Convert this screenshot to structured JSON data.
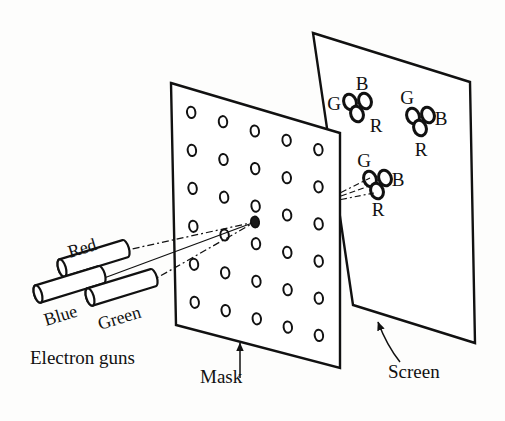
{
  "figure": {
    "background_color": "#fdfdfc",
    "ink_color": "#111111"
  },
  "labels": {
    "electron_guns": "Electron guns",
    "mask": "Mask",
    "screen": "Screen",
    "gun_red": "Red",
    "gun_blue": "Blue",
    "gun_green": "Green"
  },
  "guns": [
    {
      "name": "Red",
      "label": "Red",
      "x": 62,
      "y": 268,
      "length": 66,
      "radius": 9,
      "angle": -17,
      "label_x": 70,
      "label_y": 258
    },
    {
      "name": "Blue",
      "label": "Blue",
      "x": 38,
      "y": 294,
      "length": 66,
      "radius": 9,
      "angle": -17,
      "label_x": 46,
      "label_y": 326
    },
    {
      "name": "Green",
      "label": "Green",
      "x": 90,
      "y": 297,
      "length": 66,
      "radius": 9,
      "angle": -17,
      "label_x": 100,
      "label_y": 330
    }
  ],
  "mask": {
    "label": "Mask",
    "corners": [
      [
        171,
        83
      ],
      [
        340,
        133
      ],
      [
        340,
        368
      ],
      [
        176,
        325
      ]
    ],
    "hole_rows": 6,
    "hole_cols": 5,
    "hole_rx": 4.2,
    "hole_ry": 5.6,
    "label_x": 200,
    "label_y": 383,
    "arrow_from": [
      240,
      378
    ],
    "arrow_to": [
      240,
      343
    ]
  },
  "screen": {
    "label": "Screen",
    "corners": [
      [
        313,
        33
      ],
      [
        470,
        82
      ],
      [
        475,
        343
      ],
      [
        353,
        305
      ]
    ],
    "label_x": 388,
    "label_y": 378,
    "arrow_from": [
      400,
      362
    ],
    "arrow_to": [
      378,
      322
    ]
  },
  "triads": [
    {
      "name": "triad-upper-left",
      "cx": 358,
      "cy": 106,
      "dots": [
        {
          "phosphor": "G",
          "dx": -8,
          "dy": -4
        },
        {
          "phosphor": "B",
          "dx": 7,
          "dy": -5
        },
        {
          "phosphor": "R",
          "dx": -1,
          "dy": 8
        }
      ],
      "labels": [
        {
          "text": "G",
          "x": 334,
          "y": 106
        },
        {
          "text": "B",
          "x": 362,
          "y": 86
        },
        {
          "text": "R",
          "x": 376,
          "y": 128
        }
      ]
    },
    {
      "name": "triad-upper-right",
      "cx": 421,
      "cy": 120,
      "dots": [
        {
          "phosphor": "G",
          "dx": -8,
          "dy": -4
        },
        {
          "phosphor": "B",
          "dx": 7,
          "dy": -5
        },
        {
          "phosphor": "R",
          "dx": -1,
          "dy": 8
        }
      ],
      "labels": [
        {
          "text": "G",
          "x": 407,
          "y": 100
        },
        {
          "text": "B",
          "x": 441,
          "y": 121
        },
        {
          "text": "R",
          "x": 421,
          "y": 152
        }
      ]
    },
    {
      "name": "triad-center",
      "cx": 378,
      "cy": 183,
      "dots": [
        {
          "phosphor": "G",
          "dx": -8,
          "dy": -4
        },
        {
          "phosphor": "B",
          "dx": 7,
          "dy": -5
        },
        {
          "phosphor": "R",
          "dx": -1,
          "dy": 8
        }
      ],
      "labels": [
        {
          "text": "G",
          "x": 364,
          "y": 163
        },
        {
          "text": "B",
          "x": 398,
          "y": 182
        },
        {
          "text": "R",
          "x": 378,
          "y": 212
        }
      ]
    }
  ],
  "beams": {
    "converge_point": [
      255,
      222
    ],
    "gun_exits": [
      [
        118,
        252
      ],
      [
        96,
        281
      ],
      [
        148,
        283
      ]
    ],
    "screen_targets": [
      [
        370,
        178
      ],
      [
        378,
        183
      ],
      [
        374,
        193
      ]
    ],
    "mask_exit": [
      341,
      196
    ]
  },
  "phosphor_legend": {
    "G": "Green phosphor dot",
    "B": "Blue phosphor dot",
    "R": "Red phosphor dot"
  }
}
